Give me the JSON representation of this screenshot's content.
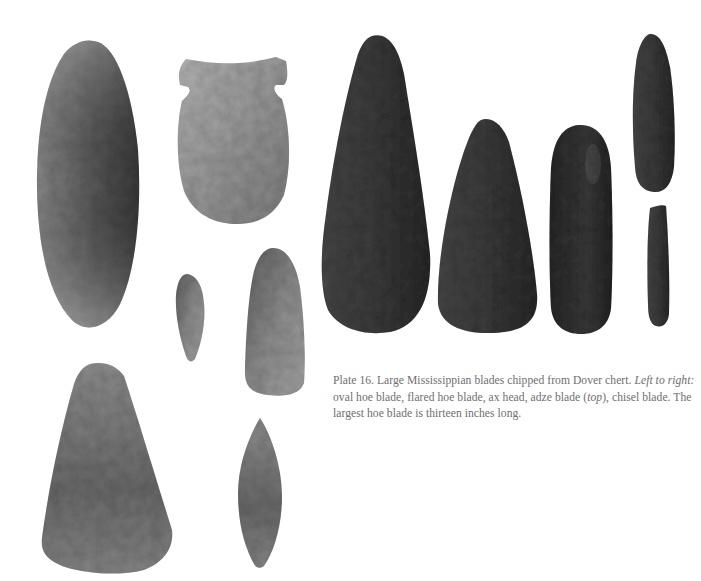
{
  "plate": {
    "number_label": "Plate 16.",
    "caption_main": "Large Mississippian blades chipped from Dover chert.",
    "caption_italic_1": "Left to right:",
    "caption_list": "oval hoe blade, flared hoe blade, ax head, adze blade (",
    "caption_italic_2": "top",
    "caption_end": "), chisel blade. The largest hoe blade is thirteen inches long."
  },
  "artifacts": {
    "left_group": [
      {
        "name": "large-oval-blade",
        "tone": "#6f6f6f"
      },
      {
        "name": "notched-hoe-blade",
        "tone": "#9a9a9a"
      },
      {
        "name": "small-point",
        "tone": "#7d7d7d"
      },
      {
        "name": "narrow-blade",
        "tone": "#868686"
      },
      {
        "name": "flared-blade",
        "tone": "#777777"
      },
      {
        "name": "leaf-blade",
        "tone": "#707070"
      }
    ],
    "right_group": [
      {
        "name": "oval-hoe-blade",
        "tone": "#404040"
      },
      {
        "name": "flared-hoe-blade",
        "tone": "#3f3f3f"
      },
      {
        "name": "ax-head",
        "tone": "#2e2e2e"
      },
      {
        "name": "adze-blade",
        "tone": "#3c3c3c"
      },
      {
        "name": "chisel-blade",
        "tone": "#404040"
      }
    ]
  }
}
